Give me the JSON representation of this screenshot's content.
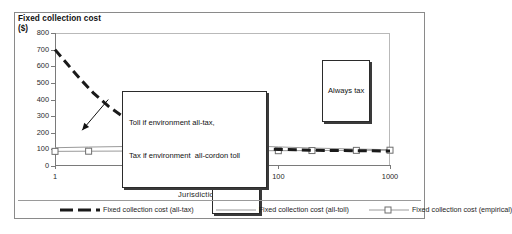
{
  "chart_data": {
    "type": "line",
    "title": "",
    "ylabel": "Fixed collection cost ($)",
    "ylabel_line1": "Fixed collection cost",
    "ylabel_line2": "($)",
    "xlabel": "Jurisdiction size  (km)",
    "xscale": "log",
    "xlim": [
      1,
      1000
    ],
    "ylim": [
      0,
      800
    ],
    "yticks": [
      800,
      700,
      600,
      500,
      400,
      300,
      200,
      100,
      0
    ],
    "xticks": [
      1,
      10,
      100,
      1000
    ],
    "grid": false,
    "legend_position": "bottom",
    "series": [
      {
        "name": "Fixed collection cost (all-tax)",
        "style": "thick-dashed",
        "color": "#1a1a1a",
        "x": [
          1,
          1.3,
          1.7,
          2.2,
          3,
          4,
          5,
          7,
          10,
          15,
          20,
          30,
          50,
          70,
          100,
          150,
          200,
          300,
          500,
          700,
          1000
        ],
        "y": [
          700,
          610,
          520,
          440,
          360,
          300,
          265,
          215,
          180,
          150,
          138,
          122,
          110,
          105,
          100,
          97,
          95,
          93,
          92,
          91,
          90
        ]
      },
      {
        "name": "Fixed collection cost (all-toll)",
        "style": "thin-solid",
        "color": "#9a9a9a",
        "x": [
          1,
          2,
          5,
          10,
          20,
          50,
          100,
          200,
          500,
          1000
        ],
        "y": [
          110,
          114,
          118,
          122,
          124,
          122,
          115,
          108,
          102,
          98
        ]
      },
      {
        "name": "Fixed collection cost (empirical)",
        "style": "thin-solid-square-markers",
        "color": "#9a9a9a",
        "marker": "square",
        "x": [
          1,
          2,
          5,
          10,
          20,
          50,
          100,
          200,
          500,
          1000
        ],
        "y": [
          88,
          89,
          90,
          90,
          91,
          92,
          92,
          93,
          94,
          95
        ]
      }
    ],
    "annotations": [
      {
        "name": "always-tax",
        "text": "Always tax",
        "x": 600,
        "y": 620
      },
      {
        "name": "always-toll",
        "text": "Always toll",
        "x": 40,
        "y": 55
      },
      {
        "name": "toll-tax-regime",
        "line1": "Toll if environment all-tax,",
        "line2": "Tax if environment  all-cordon toll",
        "arrow_from_x": 3.0,
        "arrow_from_y": 400,
        "arrow_to_x": 1.75,
        "arrow_to_y": 215
      }
    ]
  },
  "legend": {
    "items": [
      {
        "label": "Fixed collection cost (all-tax)"
      },
      {
        "label": "Fixed collection cost (all-toll)"
      },
      {
        "label": "Fixed collection cost (empirical)"
      }
    ]
  },
  "axes": {
    "y_title_line1": "Fixed collection cost",
    "y_title_line2": "($)",
    "x_title": "Jurisdiction size  (km)",
    "y_tick_labels": [
      "800",
      "700",
      "600",
      "500",
      "400",
      "300",
      "200",
      "100",
      "0"
    ],
    "x_tick_labels": [
      "1",
      "10",
      "100",
      "1000"
    ]
  },
  "callouts": {
    "always_tax": "Always tax",
    "always_toll": "Always toll",
    "toll_tax_line1": "Toll if environment all-tax,",
    "toll_tax_line2": "Tax if environment  all-cordon toll"
  }
}
